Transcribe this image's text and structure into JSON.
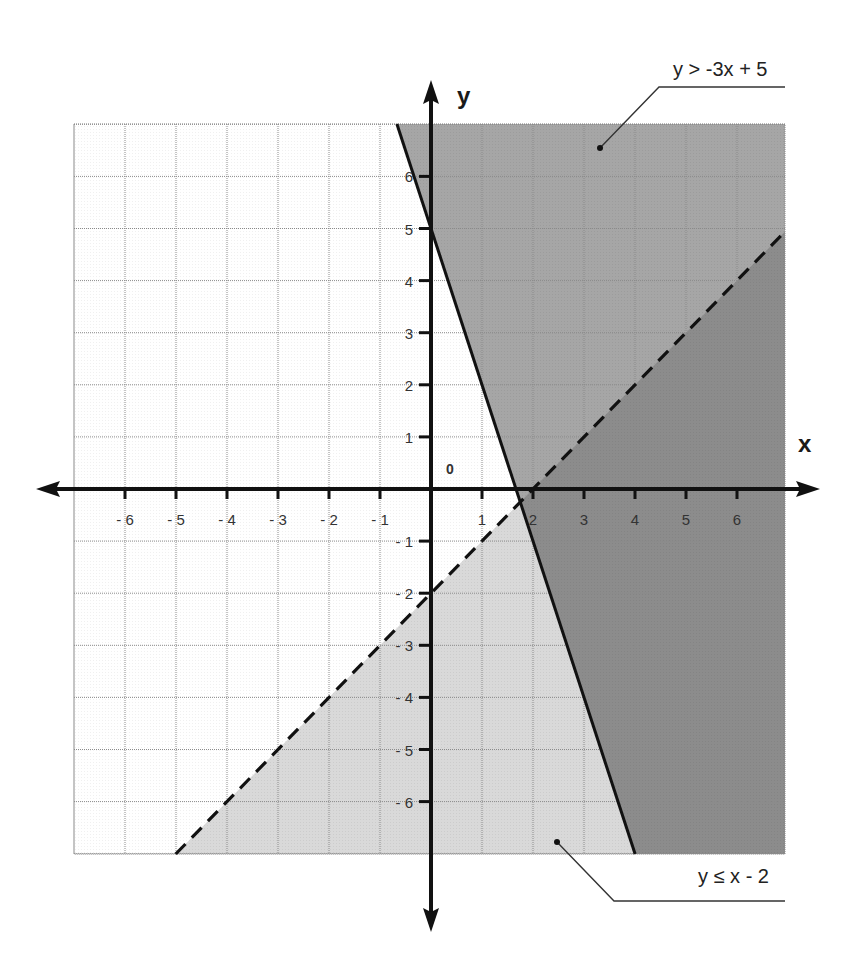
{
  "chart_data": {
    "type": "line",
    "title": "",
    "xlabel": "x",
    "ylabel": "y",
    "origin_label": "0",
    "xlim": [
      -7,
      7
    ],
    "ylim": [
      -7,
      7
    ],
    "grid": true,
    "x_ticks": [
      -6,
      -5,
      -4,
      -3,
      -2,
      -1,
      1,
      2,
      3,
      4,
      5,
      6
    ],
    "y_ticks": [
      -6,
      -5,
      -4,
      -3,
      -2,
      -1,
      1,
      2,
      3,
      4,
      5,
      6
    ],
    "x_tick_labels": [
      "- 6",
      "- 5",
      "- 4",
      "- 3",
      "- 2",
      "- 1",
      "1",
      "2",
      "3",
      "4",
      "5",
      "6"
    ],
    "y_tick_labels": [
      "- 6",
      "- 5",
      "- 4",
      "- 3",
      "- 2",
      "- 1",
      "1",
      "2",
      "3",
      "4",
      "5",
      "6"
    ],
    "series": [
      {
        "name": "y > -3x + 5",
        "equation": "y = -3x + 5",
        "slope": -3,
        "intercept": 5,
        "line_style": "solid",
        "inequality": ">",
        "shaded_region": "above",
        "shade_color": "#a6a6a6",
        "points": [
          [
            -0.67,
            7
          ],
          [
            4,
            -7
          ]
        ]
      },
      {
        "name": "y ≤ x - 2",
        "equation": "y = x - 2",
        "slope": 1,
        "intercept": -2,
        "line_style": "dashed",
        "inequality": "≤",
        "shaded_region": "below",
        "shade_color": "#d9d9d9",
        "points": [
          [
            -5,
            -7
          ],
          [
            7,
            5
          ]
        ]
      }
    ],
    "overlap_shade_color": "#8c8c8c",
    "annotations": [
      {
        "text": "y > -3x + 5",
        "position": "top-right",
        "points_to": [
          3.3,
          6.4
        ]
      },
      {
        "text": "y ≤ x - 2",
        "position": "bottom-right",
        "points_to": [
          2.6,
          -6.8
        ]
      }
    ]
  },
  "labels": {
    "x_axis": "x",
    "y_axis": "y",
    "origin": "0",
    "annotation_top": "y > -3x + 5",
    "annotation_bottom": "y ≤ x - 2"
  }
}
